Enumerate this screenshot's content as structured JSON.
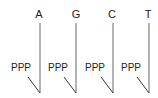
{
  "diagram": {
    "title": "",
    "nucleotides": [
      {
        "base": "A",
        "phosphate": "PPP",
        "x": 40,
        "ppp_x": 11
      },
      {
        "base": "G",
        "phosphate": "PPP",
        "x": 76,
        "ppp_x": 48
      },
      {
        "base": "C",
        "phosphate": "PPP",
        "x": 113,
        "ppp_x": 85
      },
      {
        "base": "T",
        "phosphate": "PPP",
        "x": 149,
        "ppp_x": 121
      }
    ],
    "colors": {
      "stem": "#8a8a8a",
      "link": "#333333",
      "text": "#222222"
    }
  }
}
